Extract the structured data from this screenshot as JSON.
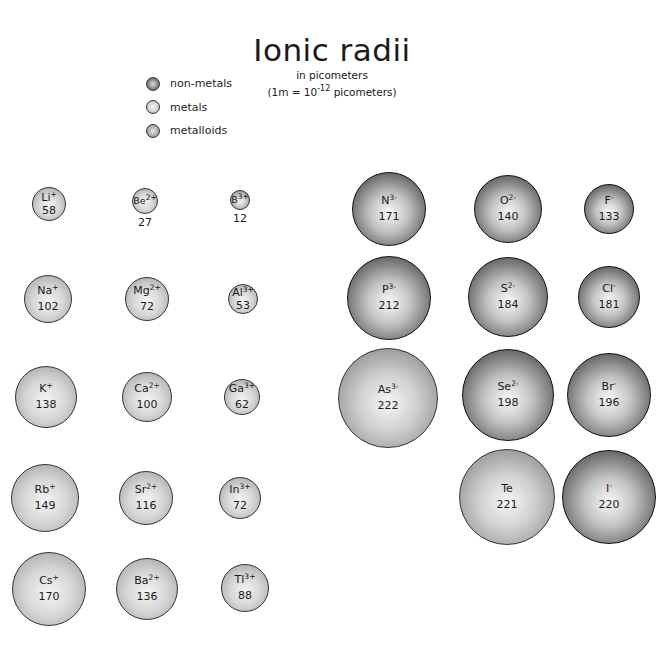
{
  "header": {
    "title": "Ionic radii",
    "subtitle_line1": "in picometers",
    "subtitle_line2_prefix": "(1m = 10",
    "subtitle_line2_exp": "-12",
    "subtitle_line2_suffix": " picometers)"
  },
  "legend": [
    {
      "label": "non-metals",
      "type": "nonmetal"
    },
    {
      "label": "metals",
      "type": "metal"
    },
    {
      "label": "metalloids",
      "type": "metalloid"
    }
  ],
  "ions": [
    {
      "el": "Li",
      "charge": "+",
      "radius": "58",
      "type": "metal",
      "cx": 49,
      "cy": 204,
      "r": 17
    },
    {
      "el": "Be",
      "charge": "2+",
      "radius": "27",
      "type": "metal",
      "cx": 145,
      "cy": 201,
      "r": 13,
      "label_below": true
    },
    {
      "el": "B",
      "charge": "3+",
      "radius": "12",
      "type": "metalloid",
      "cx": 240,
      "cy": 200,
      "r": 10,
      "label_below": true
    },
    {
      "el": "Na",
      "charge": "+",
      "radius": "102",
      "type": "metal",
      "cx": 48,
      "cy": 299,
      "r": 24
    },
    {
      "el": "Mg",
      "charge": "2+",
      "radius": "72",
      "type": "metal",
      "cx": 147,
      "cy": 299,
      "r": 22
    },
    {
      "el": "Al",
      "charge": "3+",
      "radius": "53",
      "type": "metal",
      "cx": 243,
      "cy": 299,
      "r": 15
    },
    {
      "el": "K",
      "charge": "+",
      "radius": "138",
      "type": "metal",
      "cx": 46,
      "cy": 397,
      "r": 31
    },
    {
      "el": "Ca",
      "charge": "2+",
      "radius": "100",
      "type": "metal",
      "cx": 147,
      "cy": 397,
      "r": 25
    },
    {
      "el": "Ga",
      "charge": "3+",
      "radius": "62",
      "type": "metal",
      "cx": 242,
      "cy": 397,
      "r": 18
    },
    {
      "el": "Rb",
      "charge": "+",
      "radius": "149",
      "type": "metal",
      "cx": 45,
      "cy": 498,
      "r": 34
    },
    {
      "el": "Sr",
      "charge": "2+",
      "radius": "116",
      "type": "metal",
      "cx": 146,
      "cy": 498,
      "r": 27
    },
    {
      "el": "In",
      "charge": "3+",
      "radius": "72",
      "type": "metal",
      "cx": 240,
      "cy": 498,
      "r": 21
    },
    {
      "el": "Cs",
      "charge": "+",
      "radius": "170",
      "type": "metal",
      "cx": 49,
      "cy": 589,
      "r": 37
    },
    {
      "el": "Ba",
      "charge": "2+",
      "radius": "136",
      "type": "metal",
      "cx": 147,
      "cy": 589,
      "r": 31
    },
    {
      "el": "Tl",
      "charge": "3+",
      "radius": "88",
      "type": "metal",
      "cx": 245,
      "cy": 588,
      "r": 24
    },
    {
      "el": "N",
      "charge": "3-",
      "radius": "171",
      "type": "nonmetal",
      "cx": 389,
      "cy": 209,
      "r": 37
    },
    {
      "el": "O",
      "charge": "2-",
      "radius": "140",
      "type": "nonmetal",
      "cx": 508,
      "cy": 209,
      "r": 34
    },
    {
      "el": "F",
      "charge": "-",
      "radius": "133",
      "type": "nonmetal",
      "cx": 609,
      "cy": 209,
      "r": 25
    },
    {
      "el": "P",
      "charge": "3-",
      "radius": "212",
      "type": "nonmetal",
      "cx": 389,
      "cy": 298,
      "r": 42
    },
    {
      "el": "S",
      "charge": "2-",
      "radius": "184",
      "type": "nonmetal",
      "cx": 508,
      "cy": 297,
      "r": 40
    },
    {
      "el": "Cl",
      "charge": "-",
      "radius": "181",
      "type": "nonmetal",
      "cx": 609,
      "cy": 297,
      "r": 31
    },
    {
      "el": "As",
      "charge": "3-",
      "radius": "222",
      "type": "metalloid",
      "cx": 388,
      "cy": 398,
      "r": 50
    },
    {
      "el": "Se",
      "charge": "2-",
      "radius": "198",
      "type": "nonmetal",
      "cx": 508,
      "cy": 395,
      "r": 46
    },
    {
      "el": "Br",
      "charge": "-",
      "radius": "196",
      "type": "nonmetal",
      "cx": 609,
      "cy": 395,
      "r": 42
    },
    {
      "el": "Te",
      "charge": "",
      "radius": "221",
      "type": "metalloid",
      "cx": 507,
      "cy": 497,
      "r": 48
    },
    {
      "el": "I",
      "charge": "-",
      "radius": "220",
      "type": "nonmetal",
      "cx": 609,
      "cy": 497,
      "r": 47
    }
  ]
}
